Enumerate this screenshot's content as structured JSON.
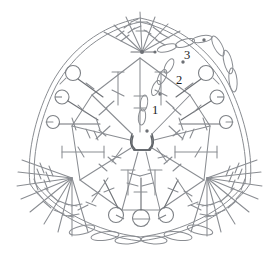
{
  "document": {
    "title": "Crochet Triangle Motif Stitch Diagram",
    "type": "crochet-pattern-chart"
  },
  "colors": {
    "stitch_gray": "#8a8d92",
    "stitch_dark_gray": "#6e7176",
    "center_ring": "#5f6368",
    "label_black": "#1a1a1a",
    "background": "#ffffff"
  },
  "labels": [
    {
      "text": "1",
      "x": 152,
      "y": 108,
      "note": "round-1-label"
    },
    {
      "text": "2",
      "x": 178,
      "y": 79,
      "note": "round-2-label"
    },
    {
      "text": "3",
      "x": 188,
      "y": 53,
      "note": "round-3-label"
    }
  ],
  "legend_symbols": {
    "chain_stitch": "oval",
    "double_crochet": "line-with-one-crossbar",
    "treble_crochet": "line-with-two-crossbars",
    "picot_loop": "small-circle-on-stem",
    "magic_ring": "rounded-square-center"
  },
  "structure": {
    "shape": "rounded-triangle",
    "rounds": 3,
    "corner_nodes": 3,
    "center": {
      "x": 140,
      "y": 138
    }
  }
}
